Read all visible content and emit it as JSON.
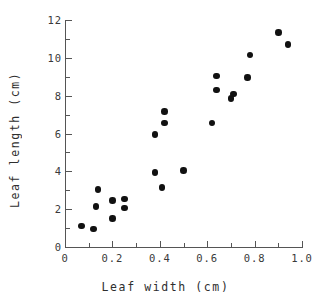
{
  "chart_data": {
    "type": "scatter",
    "title": "",
    "xlabel": "Leaf width (cm)",
    "ylabel": "Leaf length (cm)",
    "xlim": [
      0,
      1.0
    ],
    "ylim": [
      0,
      12
    ],
    "grid": false,
    "legend": null,
    "marker": {
      "shape": "circle",
      "color": "#111111",
      "size": 6.5
    },
    "xticks": [
      0,
      0.2,
      0.4,
      0.6,
      0.8,
      1.0
    ],
    "xtick_labels": [
      "0",
      "0.2",
      "0.4",
      "0.6",
      "0.8",
      "1.0"
    ],
    "xticks_minor": [
      0.1,
      0.3,
      0.5,
      0.7,
      0.9
    ],
    "yticks": [
      0,
      2,
      4,
      6,
      8,
      10,
      12
    ],
    "ytick_labels": [
      "0",
      "2",
      "4",
      "6",
      "8",
      "10",
      "12"
    ],
    "yticks_minor": [
      1,
      3,
      5,
      7,
      9,
      11
    ],
    "points": [
      {
        "x": 0.07,
        "y": 1.1
      },
      {
        "x": 0.12,
        "y": 0.95
      },
      {
        "x": 0.14,
        "y": 3.05
      },
      {
        "x": 0.13,
        "y": 2.15
      },
      {
        "x": 0.2,
        "y": 2.45
      },
      {
        "x": 0.2,
        "y": 1.5
      },
      {
        "x": 0.25,
        "y": 2.55
      },
      {
        "x": 0.25,
        "y": 2.05
      },
      {
        "x": 0.38,
        "y": 5.95
      },
      {
        "x": 0.42,
        "y": 7.15
      },
      {
        "x": 0.42,
        "y": 6.55
      },
      {
        "x": 0.38,
        "y": 3.95
      },
      {
        "x": 0.41,
        "y": 3.15
      },
      {
        "x": 0.5,
        "y": 4.05
      },
      {
        "x": 0.62,
        "y": 6.55
      },
      {
        "x": 0.64,
        "y": 9.05
      },
      {
        "x": 0.64,
        "y": 8.3
      },
      {
        "x": 0.7,
        "y": 7.85
      },
      {
        "x": 0.71,
        "y": 8.1
      },
      {
        "x": 0.77,
        "y": 8.95
      },
      {
        "x": 0.78,
        "y": 10.15
      },
      {
        "x": 0.9,
        "y": 11.35
      },
      {
        "x": 0.94,
        "y": 10.7
      }
    ]
  },
  "axes": {
    "x_title": "Leaf width (cm)",
    "y_title": "Leaf length (cm)"
  },
  "colors": {
    "marker": "#111111",
    "axis": "#555555",
    "text": "#2e2e2e",
    "background": "#ffffff"
  }
}
